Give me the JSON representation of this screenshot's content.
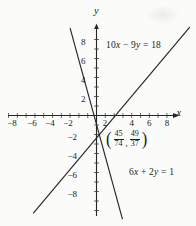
{
  "figure": {
    "axis_letters": {
      "x": "x",
      "y": "y"
    },
    "equations": {
      "line1": {
        "c1": "10",
        "v1": "x",
        "c2": " − 9",
        "v2": "y",
        "c3": " = 18"
      },
      "line2": {
        "c1": "6",
        "v1": "x",
        "c2": " + 2",
        "v2": "y",
        "c3": " = 1"
      }
    },
    "point_label": {
      "open": "(",
      "f1_num": "45",
      "f1_den": "74",
      "comma": ",",
      "f2_num": "49",
      "f2_den": "37",
      "close": ")"
    }
  },
  "chart_data": {
    "type": "line",
    "title": "",
    "xlabel": "x",
    "ylabel": "y",
    "x_range": [
      -10,
      9.8
    ],
    "y_range": [
      -10.9,
      9.3
    ],
    "x_tick_step": 1,
    "y_tick_step": 1,
    "labels_every": 2,
    "grid": false,
    "x_tick_labels": [
      -8,
      -6,
      -4,
      -2,
      2,
      4,
      6,
      8
    ],
    "y_tick_labels": [
      8,
      6,
      4,
      2,
      -2,
      -4,
      -6,
      -8
    ],
    "series": [
      {
        "name": "10x − 9y = 18",
        "slope": 1.111,
        "y_intercept": -2,
        "x_intercept": 1.8,
        "segment": [
          [
            -7.2,
            -10.3
          ],
          [
            10.6,
            9.3
          ]
        ]
      },
      {
        "name": "6x + 2y = 1",
        "slope": -3,
        "y_intercept": 0.5,
        "x_intercept": 0.167,
        "segment": [
          [
            -3.0,
            9.2
          ],
          [
            2.95,
            -10.9
          ]
        ]
      }
    ],
    "intersection": {
      "label_as_printed": "(45/74, 49/37)",
      "x_fraction": "45/74",
      "y_fraction": "49/37",
      "x": 0.608,
      "y": 1.324
    }
  }
}
